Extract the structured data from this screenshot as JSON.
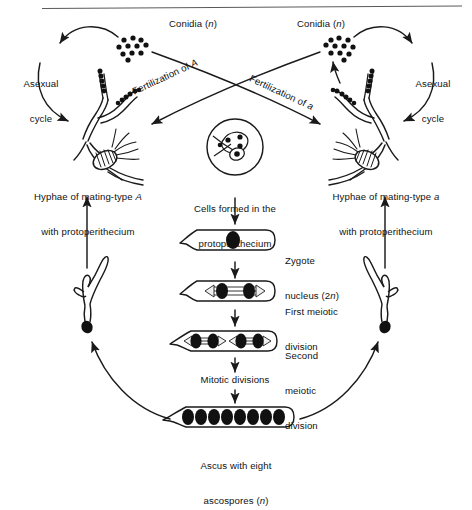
{
  "figure": {
    "kind": "neurospora-life-cycle-diagram",
    "top_rule": true,
    "ink_color": "#1a1a1a",
    "background": "#ffffff"
  },
  "labels": {
    "conidia_left": "Conidia (",
    "conidia_left_italic": "n",
    "conidia_left_tail": ")",
    "conidia_right": "Conidia (",
    "conidia_right_italic": "n",
    "conidia_right_tail": ")",
    "asexual_left_line1": "Asexual",
    "asexual_left_line2": "cycle",
    "asexual_right_line1": "Asexual",
    "asexual_right_line2": "cycle",
    "fertilization_of_A": "Fertilization of ",
    "fertilization_of_A_italic": "A",
    "fertilization_of_a": "Fertilization of ",
    "fertilization_of_a_italic": "a",
    "hyphae_left_line1": "Hyphae of mating-type ",
    "hyphae_left_line1_italic": "A",
    "hyphae_left_line2": "with protoperithecium",
    "hyphae_right_line1": "Hyphae of mating-type ",
    "hyphae_right_line1_italic": "a",
    "hyphae_right_line2": "with protoperithecium",
    "cells_formed_line1": "Cells formed in the",
    "cells_formed_line2": "protoperithecium",
    "zygote_line1": "Zygote",
    "zygote_line2": "nucleus (2",
    "zygote_line2_italic": "n",
    "zygote_line2_tail": ")",
    "first_meiotic_line1": "First meiotic",
    "first_meiotic_line2": "division",
    "second_meiotic_line1": "Second",
    "second_meiotic_line2": "meiotic",
    "second_meiotic_line3": "division",
    "mitotic_divisions": "Mitotic divisions",
    "ascus_line1": "Ascus with eight",
    "ascus_line2": "ascospores (",
    "ascus_line2_italic": "n",
    "ascus_line2_tail": ")"
  },
  "diagram_data": {
    "conidia_dot_count_left": 11,
    "conidia_dot_count_right": 11,
    "protoperithecium_cell_nuclei": 4,
    "zygote_nuclei": 1,
    "first_meiotic_nuclei": 2,
    "second_meiotic_nuclei": 4,
    "ascospore_count": 8,
    "stages": [
      "Zygote nucleus (2n)",
      "First meiotic division",
      "Second meiotic division",
      "Mitotic divisions",
      "Ascus with eight ascospores (n)"
    ]
  }
}
